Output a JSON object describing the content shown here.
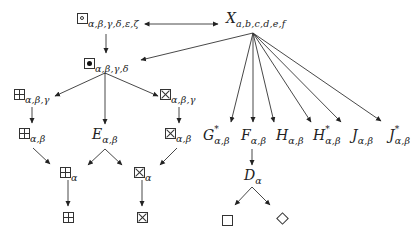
{
  "diagram": {
    "type": "hierarchy",
    "nodes": {
      "box_circle": {
        "glyph": "boxed-circle",
        "sub": "α,β,γ,δ,ε,ζ"
      },
      "x": {
        "main": "X",
        "sub": "a,b,c,d,e,f"
      },
      "box_dot": {
        "glyph": "boxed-dot",
        "sub": "α,β,γ,δ"
      },
      "plus_abg": {
        "glyph": "boxed-plus",
        "sub": "α,β,γ"
      },
      "e_ab": {
        "main": "E",
        "sub": "α,β"
      },
      "cross_abg": {
        "glyph": "boxed-cross",
        "sub": "α,β,γ"
      },
      "plus_ab": {
        "glyph": "boxed-plus",
        "sub": "α,β"
      },
      "cross_ab": {
        "glyph": "boxed-cross",
        "sub": "α,β"
      },
      "plus_a": {
        "glyph": "boxed-plus",
        "sub": "α"
      },
      "cross_a": {
        "glyph": "boxed-cross",
        "sub": "α"
      },
      "plus": {
        "glyph": "boxed-plus"
      },
      "cross": {
        "glyph": "boxed-cross"
      },
      "g_star": {
        "main": "G",
        "sup": "*",
        "sub": "α,β"
      },
      "f_ab": {
        "main": "F",
        "sub": "α,β"
      },
      "h_ab": {
        "main": "H",
        "sub": "α,β"
      },
      "h_star": {
        "main": "H",
        "sup": "*",
        "sub": "α,β"
      },
      "j_ab": {
        "main": "J",
        "sub": "α,β"
      },
      "j_star": {
        "main": "J",
        "sup": "*",
        "sub": "α,β"
      },
      "d_a": {
        "main": "D",
        "sub": "α"
      },
      "square": {
        "glyph": "square"
      },
      "diamond": {
        "glyph": "diamond"
      }
    },
    "edges": [
      [
        "box_circle",
        "x",
        "bidirectional"
      ],
      [
        "box_circle",
        "box_dot"
      ],
      [
        "x",
        "box_dot"
      ],
      [
        "box_dot",
        "plus_abg"
      ],
      [
        "box_dot",
        "e_ab"
      ],
      [
        "box_dot",
        "cross_abg"
      ],
      [
        "plus_abg",
        "plus_ab"
      ],
      [
        "cross_abg",
        "cross_ab"
      ],
      [
        "plus_ab",
        "plus_a"
      ],
      [
        "e_ab",
        "plus_a"
      ],
      [
        "e_ab",
        "cross_a"
      ],
      [
        "cross_ab",
        "cross_a"
      ],
      [
        "plus_a",
        "plus"
      ],
      [
        "cross_a",
        "cross"
      ],
      [
        "x",
        "g_star"
      ],
      [
        "x",
        "f_ab"
      ],
      [
        "x",
        "h_ab"
      ],
      [
        "x",
        "h_star"
      ],
      [
        "x",
        "j_ab"
      ],
      [
        "x",
        "j_star"
      ],
      [
        "f_ab",
        "d_a"
      ],
      [
        "d_a",
        "square"
      ],
      [
        "d_a",
        "diamond"
      ]
    ]
  }
}
